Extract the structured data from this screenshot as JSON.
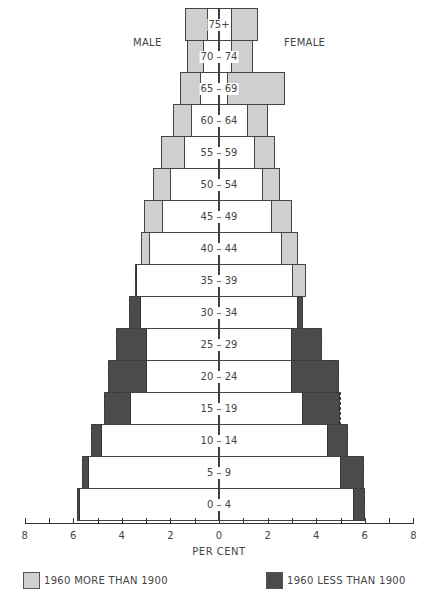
{
  "chart_data": {
    "type": "bar",
    "subtype": "population-pyramid",
    "title": "",
    "xlabel": "PER CENT",
    "ylabel": "",
    "xlim": [
      -8,
      8
    ],
    "x_ticks": [
      8,
      6,
      4,
      2,
      0,
      2,
      4,
      6,
      8
    ],
    "x_tick_positions": [
      -8,
      -6,
      -4,
      -2,
      0,
      2,
      4,
      6,
      8
    ],
    "grid": false,
    "side_labels": {
      "left": "MALE",
      "right": "FEMALE"
    },
    "legend": {
      "position": "bottom",
      "entries": [
        {
          "label": "1960 MORE THAN 1900",
          "color": "#cfcfcf"
        },
        {
          "label": "1960 LESS THAN 1900",
          "color": "#4b4b4b"
        }
      ]
    },
    "categories": [
      "75+",
      "70 – 74",
      "65 – 69",
      "60 – 64",
      "55 – 59",
      "50 – 54",
      "45 – 49",
      "40 – 44",
      "35 – 39",
      "30 – 34",
      "25 – 29",
      "20 – 24",
      "15 – 19",
      "10 – 14",
      "5 – 9",
      "0 – 4"
    ],
    "series": [
      {
        "name": "Male 1960",
        "style": "solid outline",
        "values": [
          1.4,
          1.3,
          1.6,
          1.9,
          2.4,
          2.7,
          3.1,
          3.2,
          3.4,
          3.25,
          3.0,
          3.0,
          3.65,
          4.85,
          5.4,
          5.75
        ]
      },
      {
        "name": "Male 1900",
        "style": "dashed outline",
        "values": [
          0.5,
          0.65,
          0.8,
          1.15,
          1.45,
          2.0,
          2.35,
          2.9,
          3.45,
          3.7,
          4.25,
          4.55,
          4.75,
          5.25,
          5.65,
          5.85
        ]
      },
      {
        "name": "Female 1960",
        "style": "solid outline",
        "values": [
          1.6,
          1.4,
          2.7,
          2.0,
          2.3,
          2.5,
          3.0,
          3.25,
          3.6,
          3.25,
          3.0,
          3.0,
          3.45,
          4.5,
          5.0,
          5.55
        ]
      },
      {
        "name": "Female 1900",
        "style": "dashed outline",
        "values": [
          0.55,
          0.55,
          0.35,
          1.2,
          1.5,
          1.8,
          2.2,
          2.6,
          3.05,
          3.45,
          4.25,
          4.95,
          5.0,
          5.3,
          5.95,
          6.0
        ]
      }
    ]
  },
  "labels": {
    "male": "MALE",
    "female": "FEMALE",
    "xlabel": "PER CENT",
    "legend_more": "1960 MORE THAN 1900",
    "legend_less": "1960 LESS THAN 1900"
  },
  "colors": {
    "more": "#cfcfcf",
    "less": "#4b4b4b"
  }
}
